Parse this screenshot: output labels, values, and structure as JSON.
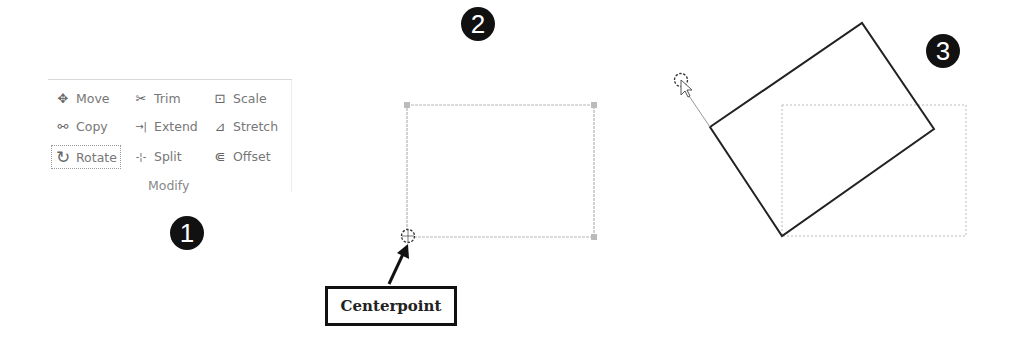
{
  "ribbon": {
    "group_label": "Modify",
    "tools": [
      {
        "label": "Move",
        "icon": "move-icon",
        "glyph": "✥"
      },
      {
        "label": "Copy",
        "icon": "copy-icon",
        "glyph": "⚯"
      },
      {
        "label": "Rotate",
        "icon": "rotate-icon",
        "glyph": "↻",
        "selected": true
      },
      {
        "label": "Trim",
        "icon": "trim-icon",
        "glyph": "✂"
      },
      {
        "label": "Extend",
        "icon": "extend-icon",
        "glyph": "→|"
      },
      {
        "label": "Split",
        "icon": "split-icon",
        "glyph": "-¦-"
      },
      {
        "label": "Scale",
        "icon": "scale-icon",
        "glyph": "⊡"
      },
      {
        "label": "Stretch",
        "icon": "stretch-icon",
        "glyph": "⊿"
      },
      {
        "label": "Offset",
        "icon": "offset-icon",
        "glyph": "⋐"
      }
    ]
  },
  "steps": [
    {
      "number": "1"
    },
    {
      "number": "2"
    },
    {
      "number": "3"
    }
  ],
  "callout": {
    "label": "Centerpoint"
  },
  "colors": {
    "badge": "#111111",
    "selected_rect": "#b0b0b0",
    "rotated_rect": "#222222",
    "ghost_rect": "#bbbbbb"
  }
}
